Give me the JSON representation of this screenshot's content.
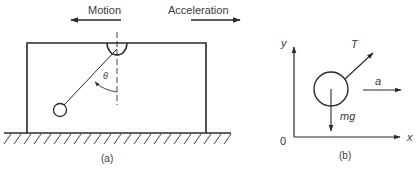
{
  "panel_a": {
    "caption": "(a)",
    "motion_label": "Motion",
    "acceleration_label": "Acceleration",
    "angle_label": "θ"
  },
  "panel_b": {
    "caption": "(b)",
    "y_axis_label": "y",
    "x_axis_label": "x",
    "origin_label": "0",
    "tension_label": "T",
    "weight_label": "mg",
    "accel_label": "a"
  },
  "colors": {
    "stroke": "#2a2a2a",
    "text": "#3a3a3a",
    "background": "#ffffff"
  }
}
